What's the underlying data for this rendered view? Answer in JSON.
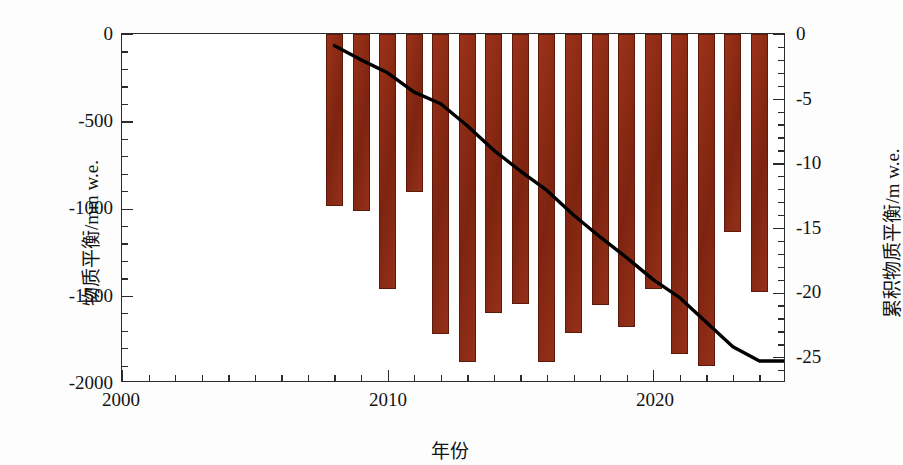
{
  "chart_data": {
    "type": "bar",
    "title": "",
    "subtitle": "",
    "xlabel": "年份",
    "ylabel": "物质平衡/mm w.e.",
    "y2label": "累积物质平衡/m w.e.",
    "grid": false,
    "legend": null,
    "xlim": [
      2000,
      2025
    ],
    "ylim": [
      -2000,
      0
    ],
    "y2lim": [
      -27,
      0
    ],
    "xticks": [
      2000,
      2010,
      2020
    ],
    "xticklabels": [
      "2000",
      "2010",
      "2020"
    ],
    "xminor_step": 1,
    "yticks": [
      0,
      -500,
      -1000,
      -1500,
      -2000
    ],
    "yticklabels": [
      "0",
      "-500",
      "-1000",
      "-1500",
      "-2000"
    ],
    "yminor_step": 100,
    "y2ticks": [
      0,
      -5,
      -10,
      -15,
      -20,
      -25
    ],
    "y2ticklabels": [
      "0",
      "-5",
      "-10",
      "-15",
      "-20",
      "-25"
    ],
    "y2minor_step": 1,
    "bar_color": "#8a2914",
    "line_color": "#000000",
    "categories": [
      2008,
      2009,
      2010,
      2011,
      2012,
      2013,
      2014,
      2015,
      2016,
      2017,
      2018,
      2019,
      2020,
      2021,
      2022,
      2023,
      2024
    ],
    "series": [
      {
        "name": "物质平衡",
        "axis": "left",
        "units": "mm w.e.",
        "values": [
          -985,
          -1015,
          -1460,
          -905,
          -1720,
          -1880,
          -1600,
          -1545,
          -1880,
          -1715,
          -1555,
          -1680,
          -1460,
          -1835,
          -1900,
          -1135,
          -1480
        ]
      },
      {
        "name": "累积物质平衡",
        "axis": "right",
        "units": "m w.e.",
        "type": "line",
        "x": [
          2008,
          2009,
          2010,
          2011,
          2012,
          2013,
          2014,
          2015,
          2016,
          2017,
          2018,
          2019,
          2020,
          2021,
          2022,
          2023,
          2024,
          2025
        ],
        "values": [
          -0.9,
          -2.0,
          -3.0,
          -4.5,
          -5.4,
          -7.1,
          -9.0,
          -10.6,
          -12.1,
          -14.0,
          -15.7,
          -17.3,
          -19.0,
          -20.4,
          -22.3,
          -24.2,
          -25.3,
          -25.3
        ]
      }
    ]
  },
  "axes": {
    "left": {
      "title": "物质平衡/mm w.e.",
      "ticks": [
        "0",
        "-500",
        "-1000",
        "-1500",
        "-2000"
      ]
    },
    "right": {
      "title": "累积物质平衡/m w.e.",
      "ticks": [
        "0",
        "-5",
        "-10",
        "-15",
        "-20",
        "-25"
      ]
    },
    "bottom": {
      "title": "年份",
      "ticks": [
        "2000",
        "2010",
        "2020"
      ]
    }
  }
}
